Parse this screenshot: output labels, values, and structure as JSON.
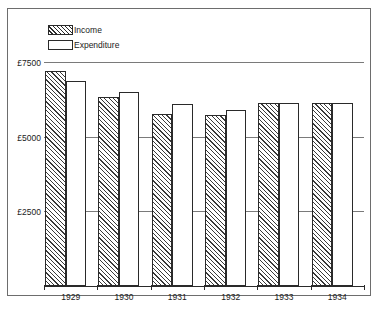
{
  "chart_data": {
    "type": "bar",
    "title": "",
    "subtitle": "",
    "xlabel": "",
    "ylabel": "",
    "categories": [
      "1929",
      "1930",
      "1931",
      "1932",
      "1933",
      "1934"
    ],
    "series": [
      {
        "name": "Income",
        "values": [
          7200,
          6330,
          5770,
          5730,
          6120,
          6120
        ]
      },
      {
        "name": "Expenditure",
        "values": [
          6850,
          6500,
          6080,
          5910,
          6120,
          6120
        ]
      }
    ],
    "ylim": [
      0,
      7500
    ],
    "yticks": [
      2500,
      5000,
      7500
    ],
    "ytick_labels": [
      "£2500",
      "£5000",
      "£7500"
    ],
    "grid": true,
    "legend_position": "top-left",
    "currency_symbol": "£"
  },
  "legend": {
    "items": [
      {
        "label": "Income",
        "swatch": "hatched-swatch"
      },
      {
        "label": "Expenditure",
        "swatch": "plain-swatch"
      }
    ]
  },
  "axis": {
    "y_labels": [
      "£7500",
      "£5000",
      "£2500"
    ],
    "x_labels": [
      "1929",
      "1930",
      "1931",
      "1932",
      "1933",
      "1934"
    ]
  }
}
